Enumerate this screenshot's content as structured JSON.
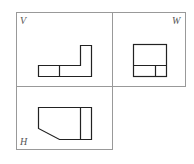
{
  "diagram": {
    "type": "three-view orthographic projection",
    "views": [
      {
        "id": "front",
        "label": "V"
      },
      {
        "id": "side",
        "label": "W"
      },
      {
        "id": "top",
        "label": "H"
      }
    ],
    "colors": {
      "frame": "#888888",
      "shape": "#222222",
      "label": "#555555"
    }
  }
}
